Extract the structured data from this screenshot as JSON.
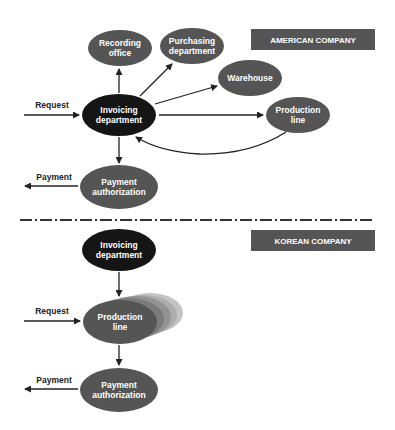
{
  "american": {
    "banner": "AMERICAN COMPANY",
    "nodes": {
      "recording": [
        "Recording",
        "office"
      ],
      "purchasing": [
        "Purchasing",
        "department"
      ],
      "warehouse": [
        "Warehouse"
      ],
      "invoicing": [
        "Invoicing",
        "department"
      ],
      "production": [
        "Production",
        "line"
      ],
      "payment": [
        "Payment",
        "authorization"
      ]
    },
    "edges": {
      "request": "Request",
      "payment": "Payment"
    }
  },
  "korean": {
    "banner": "KOREAN COMPANY",
    "nodes": {
      "invoicing": [
        "Invoicing",
        "department"
      ],
      "production": [
        "Production",
        "line"
      ],
      "payment": [
        "Payment",
        "authorization"
      ]
    },
    "edges": {
      "request": "Request",
      "payment": "Payment"
    }
  },
  "colors": {
    "node": "#555555",
    "node_dark": "#151515",
    "banner": "#555555",
    "arrow": "#222222"
  }
}
